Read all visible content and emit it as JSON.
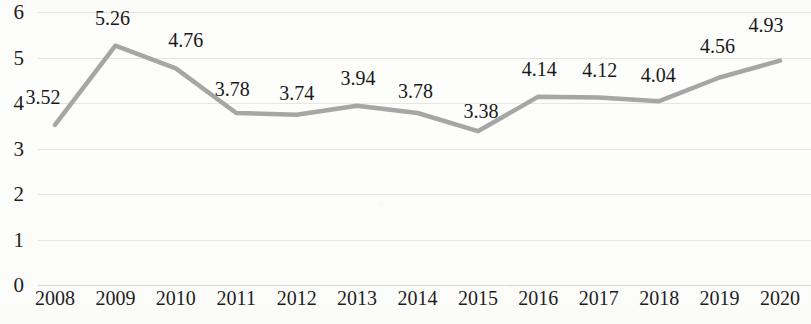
{
  "chart_data": {
    "type": "line",
    "title": "",
    "subtitle": "",
    "xlabel": "",
    "ylabel": "",
    "categories": [
      "2008",
      "2009",
      "2010",
      "2011",
      "2012",
      "2013",
      "2014",
      "2015",
      "2016",
      "2017",
      "2018",
      "2019",
      "2020"
    ],
    "values": [
      3.52,
      5.26,
      4.76,
      3.78,
      3.74,
      3.94,
      3.78,
      3.38,
      4.14,
      4.12,
      4.04,
      4.56,
      4.93
    ],
    "data_labels": [
      "3.52",
      "5.26",
      "4.76",
      "3.78",
      "3.74",
      "3.94",
      "3.78",
      "3.38",
      "4.14",
      "4.12",
      "4.04",
      "4.56",
      "4.93"
    ],
    "ylim": [
      0,
      6
    ],
    "ytick_labels": [
      "0",
      "1",
      "2",
      "3",
      "4",
      "5",
      "6"
    ],
    "ytick_values": [
      0,
      1,
      2,
      3,
      4,
      5,
      6
    ],
    "grid": true,
    "grid_axis": "y",
    "legend": false,
    "legend_position": "none",
    "markers": false,
    "series_color": "#a6a6a6",
    "grid_color": "#e6e6e6",
    "text_color": "#1d1d1d",
    "background_color": "#fdfdfc"
  }
}
